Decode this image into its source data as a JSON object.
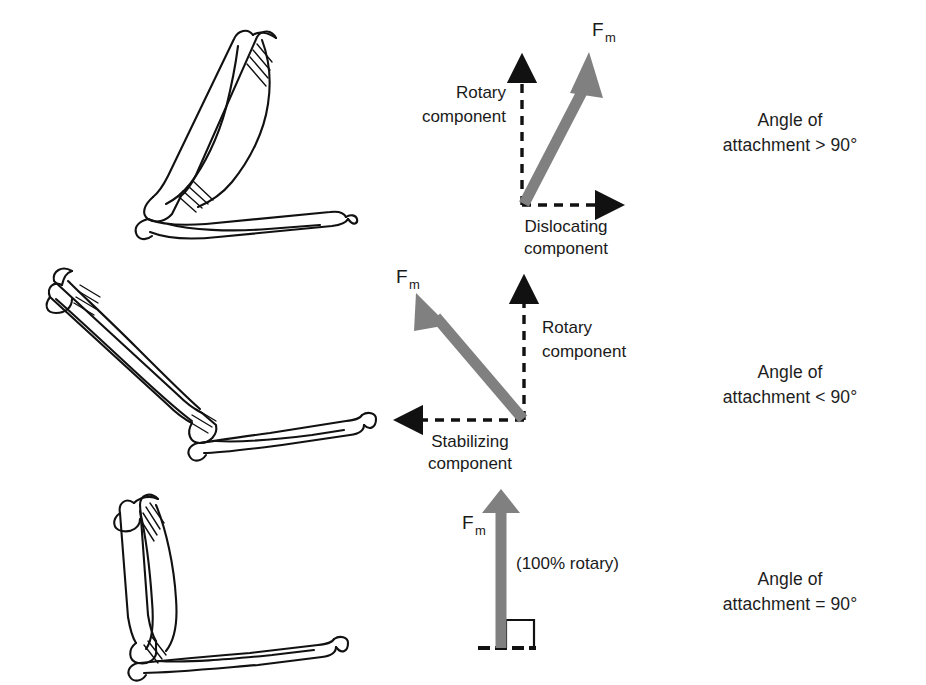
{
  "figure": {
    "force_vector_color": "#808080",
    "component_line_color": "#111111",
    "bone_line_color": "#111111",
    "background": "#ffffff"
  },
  "panels": [
    {
      "id": "panel-greater-than-90",
      "force_label": "F",
      "force_subscript": "m",
      "vertical_component": {
        "line1": "Rotary",
        "line2": "component"
      },
      "horizontal_component": {
        "line1": "Dislocating",
        "line2": "component"
      },
      "caption": {
        "line1": "Angle of",
        "line2": "attachment > 90°"
      },
      "arm_position": "flexed-acute-elbow"
    },
    {
      "id": "panel-less-than-90",
      "force_label": "F",
      "force_subscript": "m",
      "vertical_component": {
        "line1": "Rotary",
        "line2": "component"
      },
      "horizontal_component": {
        "line1": "Stabilizing",
        "line2": "component"
      },
      "caption": {
        "line1": "Angle of",
        "line2": "attachment < 90°"
      },
      "arm_position": "extended-obtuse-elbow"
    },
    {
      "id": "panel-equal-90",
      "force_label": "F",
      "force_subscript": "m",
      "rotary_note": "(100% rotary)",
      "caption": {
        "line1": "Angle of",
        "line2": "attachment = 90°"
      },
      "arm_position": "right-angle-elbow"
    }
  ]
}
